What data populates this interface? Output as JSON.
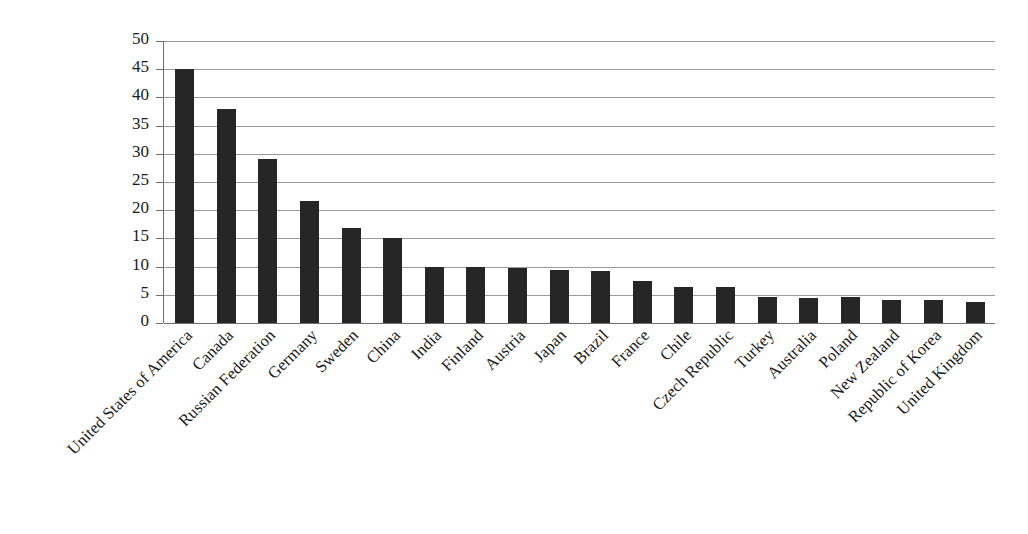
{
  "chart_data": {
    "type": "bar",
    "title": "",
    "subtitle": "",
    "xlabel": "",
    "ylabel": "Million cubic meters",
    "ylim": [
      0,
      50
    ],
    "ytick_step": 5,
    "yticks": [
      50,
      45,
      40,
      35,
      30,
      25,
      20,
      15,
      10,
      5,
      0
    ],
    "grid": true,
    "legend": false,
    "orientation": "vertical",
    "bar_color": "#262626",
    "gridline_color": "#9a9a9a",
    "axis_color": "#6e6e6e",
    "background_color": "#ffffff",
    "x_label_rotation_deg": -45,
    "categories": [
      "United States of America",
      "Canada",
      "Russian Federation",
      "Germany",
      "Sweden",
      "China",
      "India",
      "Finland",
      "Austria",
      "Japan",
      "Brazil",
      "France",
      "Chile",
      "Czech Republic",
      "Turkey",
      "Australia",
      "Poland",
      "New Zealand",
      "Republic of Korea",
      "United Kingdom"
    ],
    "values": [
      45.0,
      38.0,
      29.0,
      21.7,
      16.8,
      15.0,
      10.0,
      10.0,
      9.8,
      9.4,
      9.2,
      7.4,
      6.3,
      6.3,
      4.6,
      4.5,
      4.6,
      4.1,
      4.1,
      3.8
    ]
  }
}
